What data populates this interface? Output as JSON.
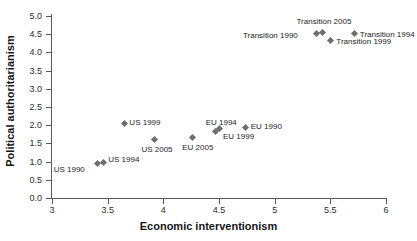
{
  "chart_data": {
    "type": "scatter",
    "title": "",
    "xlabel": "Economic interventionism",
    "ylabel": "Political authoritarianism",
    "xlim": [
      3,
      6
    ],
    "ylim": [
      0.0,
      5.0
    ],
    "xticks": [
      "3",
      "3.5",
      "4",
      "4.5",
      "5",
      "5.5",
      "6"
    ],
    "xtick_values": [
      3,
      3.5,
      4,
      4.5,
      5,
      5.5,
      6
    ],
    "yticks": [
      "0.0",
      "0.5",
      "1.0",
      "1.5",
      "2.0",
      "2.5",
      "3.0",
      "3.5",
      "4.0",
      "4.5",
      "5.0"
    ],
    "ytick_values": [
      0.0,
      0.5,
      1.0,
      1.5,
      2.0,
      2.5,
      3.0,
      3.5,
      4.0,
      4.5,
      5.0
    ],
    "grid": false,
    "legend": "none",
    "marker_color": "#6e6e70",
    "axis_color": "#59595b",
    "points": [
      {
        "label": "US 1990",
        "x": 3.41,
        "y": 0.95,
        "label_dx": -44,
        "label_dy": 7
      },
      {
        "label": "US 1994",
        "x": 3.46,
        "y": 0.97,
        "label_dx": 5,
        "label_dy": -3
      },
      {
        "label": "US 1999",
        "x": 3.65,
        "y": 2.06,
        "label_dx": 5,
        "label_dy": 0
      },
      {
        "label": "US 2005",
        "x": 3.92,
        "y": 1.6,
        "label_dx": -13,
        "label_dy": 10
      },
      {
        "label": "EU 2005",
        "x": 4.26,
        "y": 1.65,
        "label_dx": -10,
        "label_dy": 10
      },
      {
        "label": "EU 1994",
        "x": 4.47,
        "y": 1.82,
        "label_dx": -10,
        "label_dy": -9
      },
      {
        "label": "EU 1999",
        "x": 4.5,
        "y": 1.9,
        "label_dx": 4,
        "label_dy": 8
      },
      {
        "label": "EU 1990",
        "x": 4.74,
        "y": 1.93,
        "label_dx": 5,
        "label_dy": -1
      },
      {
        "label": "Transition 1990",
        "x": 5.38,
        "y": 4.51,
        "label_dx": -74,
        "label_dy": 2
      },
      {
        "label": "Transition 2005",
        "x": 5.43,
        "y": 4.56,
        "label_dx": -26,
        "label_dy": -10
      },
      {
        "label": "Transition 1999",
        "x": 5.5,
        "y": 4.34,
        "label_dx": 6,
        "label_dy": 2
      },
      {
        "label": "Transition 1994",
        "x": 5.72,
        "y": 4.51,
        "label_dx": 5,
        "label_dy": 1
      }
    ]
  }
}
